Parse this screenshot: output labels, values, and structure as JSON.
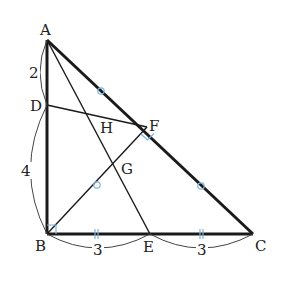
{
  "figure": {
    "type": "geometry-diagram",
    "colors": {
      "line": "#1a1a1a",
      "marker": "#7fb3d9",
      "background": "#ffffff"
    },
    "points": {
      "A": {
        "label": "A",
        "x": 47,
        "y": 40
      },
      "B": {
        "label": "B",
        "x": 47,
        "y": 234
      },
      "C": {
        "label": "C",
        "x": 253,
        "y": 234
      },
      "D": {
        "label": "D",
        "x": 47,
        "y": 105
      },
      "E": {
        "label": "E",
        "x": 150,
        "y": 234
      },
      "F": {
        "label": "F",
        "x": 147,
        "y": 127
      },
      "G": {
        "label": "G",
        "x": 126,
        "y": 151
      },
      "H": {
        "label": "H",
        "x": 108,
        "y": 112
      }
    },
    "segments": [
      {
        "from": "A",
        "to": "B",
        "bold": true
      },
      {
        "from": "B",
        "to": "C",
        "bold": true
      },
      {
        "from": "A",
        "to": "C",
        "bold": true
      },
      {
        "from": "A",
        "to": "E",
        "bold": false
      },
      {
        "from": "D",
        "to": "F",
        "bold": false
      },
      {
        "from": "B",
        "to": "F",
        "bold": false
      }
    ],
    "lengths": {
      "AD": "2",
      "DB": "4",
      "BE": "3",
      "EC": "3"
    },
    "markers": {
      "right_angles": [
        "B",
        "F"
      ],
      "equal_circle_marks": [
        "AF",
        "FC",
        "BF"
      ],
      "equal_tick_marks": [
        "BE",
        "EC"
      ]
    }
  }
}
